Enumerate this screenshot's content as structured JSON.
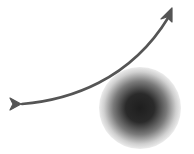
{
  "diagram": {
    "type": "trajectory-deflection",
    "elements": [
      {
        "id": "trajectory",
        "kind": "curved-arrow",
        "color": "#555555"
      },
      {
        "id": "body",
        "kind": "shaded-sphere",
        "core_color": "#1e1e1e",
        "edge_color": "#e6e6e6"
      }
    ]
  },
  "colors": {
    "arrow": "#555555",
    "sphere_core": "#1e1e1e",
    "sphere_mid": "#6a6a6a",
    "sphere_edge": "#e8e8e8",
    "background": "#ffffff"
  }
}
